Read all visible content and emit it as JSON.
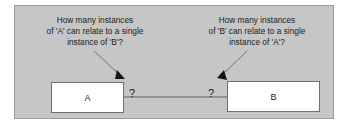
{
  "diagram": {
    "panel_background": "#c6c6c6",
    "panel_border": "#9a9a9a",
    "notes": {
      "left": {
        "line1": "How many instances",
        "line2": "of 'A' can relate to a single",
        "line3": "instance of 'B'?"
      },
      "right": {
        "line1": "How many instances",
        "line2": "of 'B' can relate to a single",
        "line3": "instance of 'A'?"
      }
    },
    "entities": {
      "a": {
        "label": "A"
      },
      "b": {
        "label": "B"
      }
    },
    "cardinality": {
      "left": "?",
      "right": "?"
    },
    "colors": {
      "box_fill": "#ffffff",
      "box_border": "#6f6f6f",
      "line": "#5e5e5e",
      "text": "#1c1c1c"
    }
  }
}
